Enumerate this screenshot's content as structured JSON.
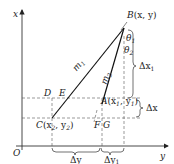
{
  "diagram": {
    "axes": {
      "vertical_label": "x",
      "horizontal_label": "y",
      "origin_label": "O"
    },
    "points": {
      "B": {
        "name": "B",
        "coords": "(x, y)"
      },
      "A": {
        "name": "A",
        "coords_open": "(x",
        "coords_sub1": "1",
        "coords_mid": ", y",
        "coords_sub2": "1",
        "coords_close": ")"
      },
      "C": {
        "name": "C",
        "coords_open": "(x",
        "coords_sub1": "2",
        "coords_mid": ", y",
        "coords_sub2": "2",
        "coords_close": ")"
      },
      "D": "D",
      "E": "E",
      "F": "F",
      "G": "G"
    },
    "segments": {
      "m1": {
        "name": "m",
        "sub": "1"
      },
      "m2": {
        "name": "m",
        "sub": "2"
      }
    },
    "angles": {
      "theta1": {
        "name": "θ",
        "sub": "1"
      },
      "theta2": {
        "name": "θ",
        "sub": "2"
      }
    },
    "dimensions": {
      "dx1": {
        "name": "Δx",
        "sub": "1"
      },
      "dx": {
        "name": "Δx"
      },
      "dy": {
        "name": "Δy"
      },
      "dy1": {
        "name": "Δy",
        "sub": "1"
      }
    },
    "colors": {
      "line": "#222222",
      "dash": "#555555"
    }
  }
}
